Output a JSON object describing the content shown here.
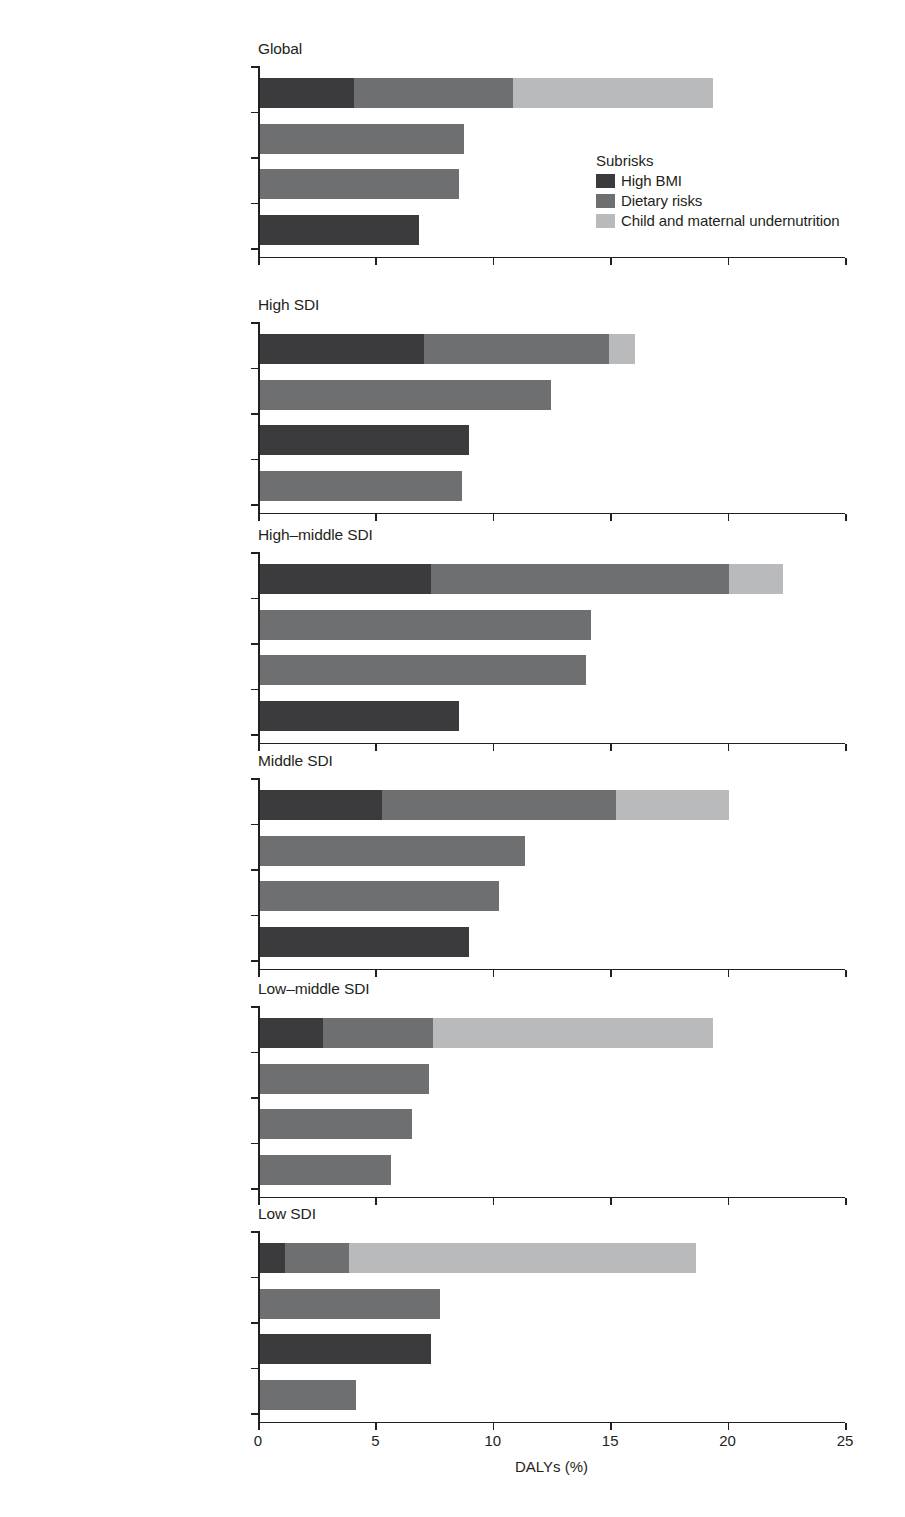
{
  "chart_data": {
    "type": "bar",
    "orientation": "horizontal",
    "stacked": true,
    "title": "",
    "xlabel": "DALYs (%)",
    "ylabel": "",
    "xlim": [
      0,
      25
    ],
    "xticks": [
      0,
      5,
      10,
      15,
      20,
      25
    ],
    "xticklabels": [
      "0",
      "5",
      "10",
      "15",
      "20",
      "25"
    ],
    "grid": false,
    "legend": {
      "title": "Subrisks",
      "position": "panel-1-inside-right",
      "entries": [
        {
          "name": "High BMI",
          "color": "#3b3b3d"
        },
        {
          "name": "Dietary risks",
          "color": "#6e6f71"
        },
        {
          "name": "Child and maternal undernutrition",
          "color": "#b9babc"
        }
      ]
    },
    "series": [
      {
        "name": "High BMI",
        "color": "#3b3b3d"
      },
      {
        "name": "Dietary risks",
        "color": "#6e6f71"
      },
      {
        "name": "Child and maternal undernutrition",
        "color": "#b9babc"
      }
    ],
    "panels": [
      {
        "title": "Global",
        "categories": [
          "Malnutrition in all its forms",
          "High systolic blood pressure",
          "Tobacco",
          "High fasting plasma glucose"
        ],
        "bars": [
          {
            "category": "Malnutrition in all its forms",
            "total": 19.3,
            "segments": [
              {
                "series": "High BMI",
                "value": 4.0
              },
              {
                "series": "Dietary risks",
                "value": 6.8
              },
              {
                "series": "Child and maternal undernutrition",
                "value": 8.5
              }
            ]
          },
          {
            "category": "High systolic blood pressure",
            "total": 8.7,
            "segments": [
              {
                "series": "Dietary risks",
                "value": 8.7
              }
            ]
          },
          {
            "category": "Tobacco",
            "total": 8.5,
            "segments": [
              {
                "series": "Dietary risks",
                "value": 8.5
              }
            ]
          },
          {
            "category": "High fasting plasma glucose",
            "total": 6.8,
            "segments": [
              {
                "series": "High BMI",
                "value": 6.8
              }
            ]
          }
        ]
      },
      {
        "title": "High SDI",
        "categories": [
          "Malnutrition in all its forms",
          "Tobacco",
          "High fasting plasma glucose",
          "High systolic blood pressure"
        ],
        "bars": [
          {
            "category": "Malnutrition in all its forms",
            "total": 16.0,
            "segments": [
              {
                "series": "High BMI",
                "value": 7.0
              },
              {
                "series": "Dietary risks",
                "value": 7.9
              },
              {
                "series": "Child and maternal undernutrition",
                "value": 1.1
              }
            ]
          },
          {
            "category": "Tobacco",
            "total": 12.4,
            "segments": [
              {
                "series": "Dietary risks",
                "value": 12.4
              }
            ]
          },
          {
            "category": "High fasting plasma glucose",
            "total": 8.9,
            "segments": [
              {
                "series": "High BMI",
                "value": 8.9
              }
            ]
          },
          {
            "category": "High systolic blood pressure",
            "total": 8.6,
            "segments": [
              {
                "series": "Dietary risks",
                "value": 8.6
              }
            ]
          }
        ]
      },
      {
        "title": "High–middle SDI",
        "categories": [
          "Malnutrition in all its forms",
          "High systolic blood pressure",
          "Tobacco",
          "High fasting plasma glucose"
        ],
        "bars": [
          {
            "category": "Malnutrition in all its forms",
            "total": 22.3,
            "segments": [
              {
                "series": "High BMI",
                "value": 7.3
              },
              {
                "series": "Dietary risks",
                "value": 12.7
              },
              {
                "series": "Child and maternal undernutrition",
                "value": 2.3
              }
            ]
          },
          {
            "category": "High systolic blood pressure",
            "total": 14.1,
            "segments": [
              {
                "series": "Dietary risks",
                "value": 14.1
              }
            ]
          },
          {
            "category": "Tobacco",
            "total": 13.9,
            "segments": [
              {
                "series": "Dietary risks",
                "value": 13.9
              }
            ]
          },
          {
            "category": "High fasting plasma glucose",
            "total": 8.5,
            "segments": [
              {
                "series": "High BMI",
                "value": 8.5
              }
            ]
          }
        ]
      },
      {
        "title": "Middle SDI",
        "categories": [
          "Malnutrition in all its forms",
          "High systolic blood pressure",
          "Tobacco",
          "High fasting plasma glucose"
        ],
        "bars": [
          {
            "category": "Malnutrition in all its forms",
            "total": 20.0,
            "segments": [
              {
                "series": "High BMI",
                "value": 5.2
              },
              {
                "series": "Dietary risks",
                "value": 10.0
              },
              {
                "series": "Child and maternal undernutrition",
                "value": 4.8
              }
            ]
          },
          {
            "category": "High systolic blood pressure",
            "total": 11.3,
            "segments": [
              {
                "series": "Dietary risks",
                "value": 11.3
              }
            ]
          },
          {
            "category": "Tobacco",
            "total": 10.2,
            "segments": [
              {
                "series": "Dietary risks",
                "value": 10.2
              }
            ]
          },
          {
            "category": "High fasting plasma glucose",
            "total": 8.9,
            "segments": [
              {
                "series": "High BMI",
                "value": 8.9
              }
            ]
          }
        ]
      },
      {
        "title": "Low–middle SDI",
        "categories": [
          "Malnutrition in all its forms",
          "High systolic blood pressure",
          "Air pollution",
          "Tobacco"
        ],
        "bars": [
          {
            "category": "Malnutrition in all its forms",
            "total": 19.3,
            "segments": [
              {
                "series": "High BMI",
                "value": 2.7
              },
              {
                "series": "Dietary risks",
                "value": 4.7
              },
              {
                "series": "Child and maternal undernutrition",
                "value": 11.9
              }
            ]
          },
          {
            "category": "High systolic blood pressure",
            "total": 7.2,
            "segments": [
              {
                "series": "Dietary risks",
                "value": 7.2
              }
            ]
          },
          {
            "category": "Air pollution",
            "total": 6.5,
            "segments": [
              {
                "series": "Dietary risks",
                "value": 6.5
              }
            ]
          },
          {
            "category": "Tobacco",
            "total": 5.6,
            "segments": [
              {
                "series": "Dietary risks",
                "value": 5.6
              }
            ]
          }
        ]
      },
      {
        "title": "Low SDI",
        "categories": [
          "Malnutrition in all its forms",
          "WASH",
          "High fasting plasma glucose",
          "High systolic blood pressure"
        ],
        "bars": [
          {
            "category": "Malnutrition in all its forms",
            "total": 18.6,
            "segments": [
              {
                "series": "High BMI",
                "value": 1.1
              },
              {
                "series": "Dietary risks",
                "value": 2.7
              },
              {
                "series": "Child and maternal undernutrition",
                "value": 14.8
              }
            ]
          },
          {
            "category": "WASH",
            "total": 7.7,
            "segments": [
              {
                "series": "Dietary risks",
                "value": 7.7
              }
            ]
          },
          {
            "category": "High fasting plasma glucose",
            "total": 7.3,
            "segments": [
              {
                "series": "High BMI",
                "value": 7.3
              }
            ]
          },
          {
            "category": "High systolic blood pressure",
            "total": 4.1,
            "segments": [
              {
                "series": "Dietary risks",
                "value": 4.1
              }
            ]
          }
        ]
      }
    ]
  }
}
